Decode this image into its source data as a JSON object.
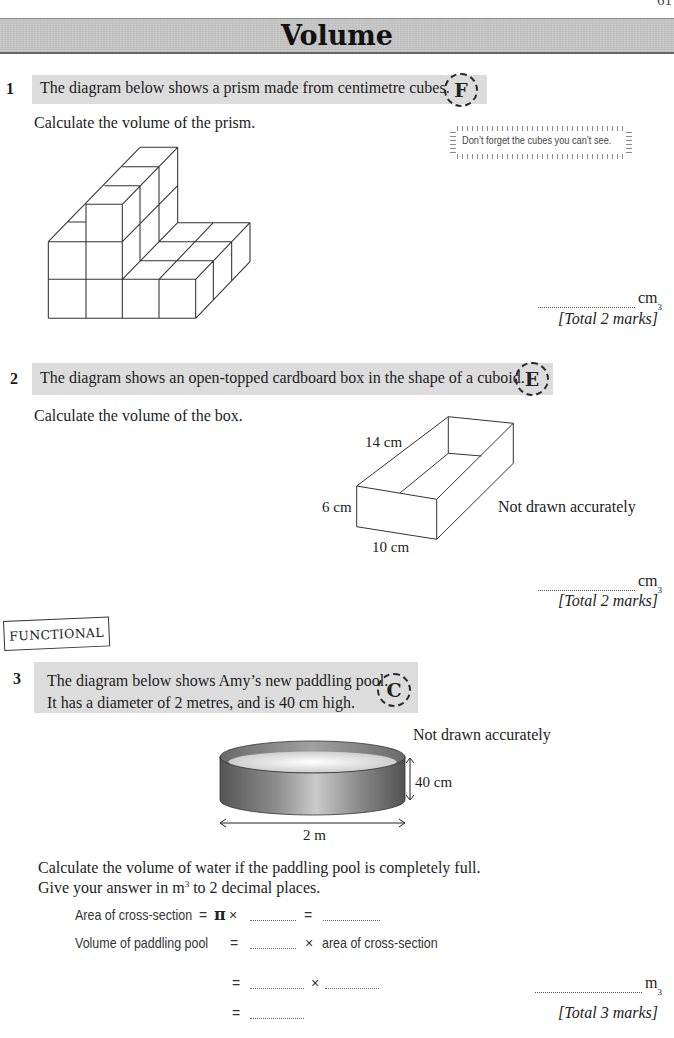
{
  "page": {
    "number": "61",
    "title": "Volume"
  },
  "theme": {
    "band": "#dcdcdc",
    "title_band": "#c6c6c6",
    "text": "#1c1c1c"
  },
  "q1": {
    "number": "1",
    "prompt": "The diagram below shows a prism made from centimetre cubes.",
    "grade": "F",
    "instruction": "Calculate the volume of the prism.",
    "hint": "Don’t forget the cubes you can’t see.",
    "answer": {
      "unit": "cm",
      "power": "3"
    },
    "marks": "[Total 2 marks]"
  },
  "q2": {
    "number": "2",
    "prompt": "The diagram shows an open-topped cardboard box in the shape of a cuboid.",
    "grade": "E",
    "instruction": "Calculate the volume of the box.",
    "diagram": {
      "length": "14 cm",
      "height": "6 cm",
      "width": "10 cm",
      "note": "Not drawn accurately"
    },
    "answer": {
      "unit": "cm",
      "power": "3"
    },
    "marks": "[Total 2 marks]"
  },
  "q3": {
    "tag": "FUNCTIONAL",
    "number": "3",
    "prompt_lines": [
      "The diagram below shows Amy’s new paddling pool.",
      "It has a diameter of 2 metres, and is 40 cm high."
    ],
    "grade": "C",
    "diagram": {
      "note": "Not drawn accurately",
      "height": "40 cm",
      "diameter": "2 m"
    },
    "instruction_line1": "Calculate the volume of water if the paddling pool is completely full.",
    "instruction_line2": {
      "before": "Give your answer in m",
      "power": "3",
      "after": " to 2 decimal places."
    },
    "working": {
      "row1": {
        "label": "Area of cross-section",
        "equals": "=",
        "pi": "π",
        "times": "×",
        "equals2": "="
      },
      "row2": {
        "label": "Volume of paddling pool",
        "equals": "=",
        "times": "×",
        "tail": "area of cross-section"
      },
      "row3": {
        "equals": "=",
        "times": "×"
      },
      "row4": {
        "equals": "="
      }
    },
    "answer": {
      "unit": "m",
      "power": "3"
    },
    "marks": "[Total 3 marks]"
  }
}
